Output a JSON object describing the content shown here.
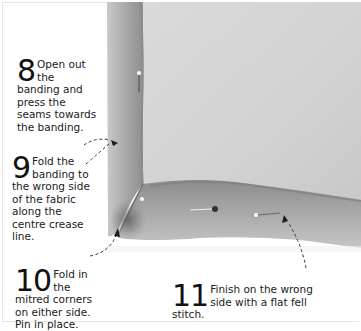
{
  "steps": [
    {
      "number": "8",
      "text": "Open out the banding and press the seams towards the banding."
    },
    {
      "number": "9",
      "text": "Fold the banding to the wrong side of the fabric along the centre crease line."
    },
    {
      "number": "10",
      "text": "Fold in the mitred corners on either side. Pin in place."
    },
    {
      "number": "11",
      "text": "Finish on the wrong side with a flat fell stitch."
    }
  ],
  "colors": {
    "fabric": "#d4d4d4",
    "banding": "#a8a8a8",
    "background": "#ffffff",
    "text": "#1a1a1a"
  }
}
